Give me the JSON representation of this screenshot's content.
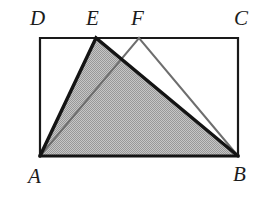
{
  "figure": {
    "canvas": {
      "width": 271,
      "height": 203,
      "background": "#ffffff"
    },
    "rectangle": {
      "name": "ABCD",
      "stroke": "#1a1a1a",
      "stroke_width": 2.2,
      "fill": "none",
      "corners": {
        "A": {
          "x": 40,
          "y": 156
        },
        "B": {
          "x": 238,
          "y": 156
        },
        "C": {
          "x": 238,
          "y": 38
        },
        "D": {
          "x": 40,
          "y": 38
        }
      }
    },
    "points_on_DC": {
      "E": {
        "x": 96,
        "y": 38
      },
      "F": {
        "x": 139,
        "y": 38
      }
    },
    "shaded_triangle": {
      "name": "AEB",
      "vertices": "A(40,156) E(96,38) B(238,156)",
      "fill": "#b0b0b0",
      "fill_pattern": "halftone-dither",
      "stroke": "#141414",
      "stroke_width": 3.4
    },
    "outline_triangle": {
      "name": "AFB",
      "vertices": "A(40,156) F(139,38) B(238,156)",
      "fill": "none",
      "stroke": "#6e6e6e",
      "stroke_width": 2.0
    },
    "labels": [
      {
        "id": "label-D",
        "text": "D",
        "x": 30,
        "y": 8
      },
      {
        "id": "label-E",
        "text": "E",
        "x": 86,
        "y": 8
      },
      {
        "id": "label-F",
        "text": "F",
        "x": 131,
        "y": 8
      },
      {
        "id": "label-C",
        "text": "C",
        "x": 234,
        "y": 8
      },
      {
        "id": "label-A",
        "text": "A",
        "x": 28,
        "y": 166
      },
      {
        "id": "label-B",
        "text": "B",
        "x": 233,
        "y": 164
      }
    ],
    "colors": {
      "background": "#ffffff",
      "rectangle_stroke": "#1a1a1a",
      "shaded_fill": "#b0b0b0",
      "dark_triangle_stroke": "#141414",
      "light_triangle_stroke": "#6e6e6e",
      "label_color": "#1c1c1c"
    }
  }
}
